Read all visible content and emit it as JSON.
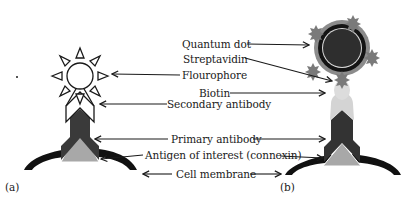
{
  "labels": {
    "quantum_dot": "Quantum dot",
    "streptavidin": "Streptavidin",
    "flourophore": "Flourophore",
    "biotin": "Biotin",
    "secondary_antibody": "Secondary antibody",
    "primary_antibody": "Primary antibody",
    "antigen": "Antigen of interest (connexin)",
    "cell_membrane": "Cell membrane"
  },
  "panels": {
    "a": "(a)",
    "b": "(b)"
  },
  "colors": {
    "background": "#ffffff",
    "outline": "#1a1a1a",
    "primary_antibody": "#3a3a3a",
    "antigen": "#a8a8a8",
    "membrane": "#111111",
    "quantum_dot_core": "#2e2e2e",
    "quantum_dot_shell": "#8c8c8c",
    "quantum_dot_ring": "#d9d9d9",
    "streptavidin": "#7a7a7a",
    "biotin_secondary": "#d4d4d4"
  }
}
